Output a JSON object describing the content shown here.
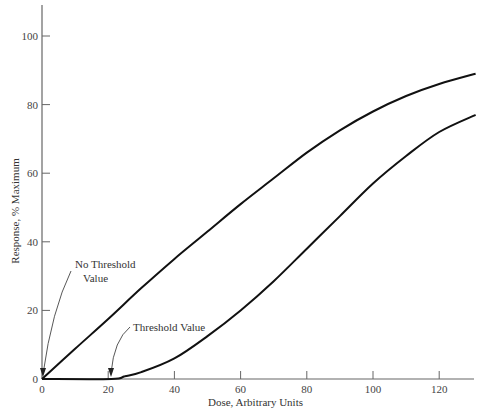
{
  "chart_data": {
    "type": "line",
    "title": "",
    "xlabel": "Dose, Arbitrary Units",
    "ylabel": "Response, % Maximum",
    "xlim": [
      0,
      132
    ],
    "ylim": [
      0,
      108
    ],
    "xticks": [
      0,
      20,
      40,
      60,
      80,
      100,
      120
    ],
    "yticks": [
      0,
      20,
      40,
      60,
      80,
      100
    ],
    "grid": false,
    "legend": null,
    "series": [
      {
        "name": "No Threshold Value",
        "x": [
          0,
          10,
          20,
          30,
          40,
          50,
          60,
          70,
          80,
          90,
          100,
          110,
          120,
          131
        ],
        "y": [
          0,
          8.8,
          17.5,
          26.5,
          35,
          43,
          51,
          58.5,
          66,
          72.5,
          78,
          82.5,
          86,
          89
        ]
      },
      {
        "name": "Threshold Value",
        "x": [
          0,
          21,
          25,
          30,
          40,
          50,
          60,
          70,
          80,
          90,
          100,
          110,
          120,
          131
        ],
        "y": [
          0,
          0,
          0.8,
          2,
          6,
          12.5,
          20,
          28.5,
          38,
          47.5,
          57,
          65,
          72,
          77
        ]
      }
    ],
    "annotations": [
      {
        "text": "No Threshold",
        "text2": "Value",
        "points_to": [
          0,
          0
        ]
      },
      {
        "text": "Threshold Value",
        "points_to": [
          21,
          0
        ]
      }
    ]
  },
  "labels": {
    "xlabel": "Dose, Arbitrary Units",
    "ylabel": "Response, % Maximum",
    "annot_no_threshold_line1": "No Threshold",
    "annot_no_threshold_line2": "Value",
    "annot_threshold": "Threshold Value",
    "xticks": [
      "0",
      "20",
      "40",
      "60",
      "80",
      "100",
      "120"
    ],
    "yticks": [
      "0",
      "20",
      "40",
      "60",
      "80",
      "100"
    ]
  }
}
